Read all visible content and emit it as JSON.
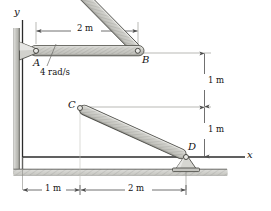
{
  "figure": {
    "axes": {
      "y_label": "y",
      "x_label": "x"
    },
    "joints": [
      {
        "name": "A",
        "label": "A",
        "x": 36,
        "y": 50,
        "type": "pin-support-wall"
      },
      {
        "name": "B",
        "label": "B",
        "x": 138,
        "y": 51,
        "type": "pin-joint"
      },
      {
        "name": "C",
        "label": "C",
        "x": 80,
        "y": 108,
        "type": "pin-joint"
      },
      {
        "name": "D",
        "label": "D",
        "x": 186,
        "y": 157,
        "type": "pin-support-ground"
      }
    ],
    "links": [
      {
        "name": "AB",
        "from": "A",
        "to": "B"
      },
      {
        "name": "BC",
        "from": "B",
        "to": "C"
      },
      {
        "name": "CD",
        "from": "C",
        "to": "D"
      }
    ],
    "annotations": {
      "angular_velocity": "4 rad/s"
    },
    "dimensions": {
      "top": "2 m",
      "right_upper": "1 m",
      "right_lower": "1 m",
      "bottom_left": "1 m",
      "bottom_right": "2 m"
    },
    "colors": {
      "line": "#2b2b2b",
      "bar_fill": "#c9c9c4",
      "bar_edge": "#4a4a4a",
      "hatch": "#8d8d8d",
      "dim_line": "#6a6a6a",
      "wall": "#bdbdbd"
    }
  }
}
